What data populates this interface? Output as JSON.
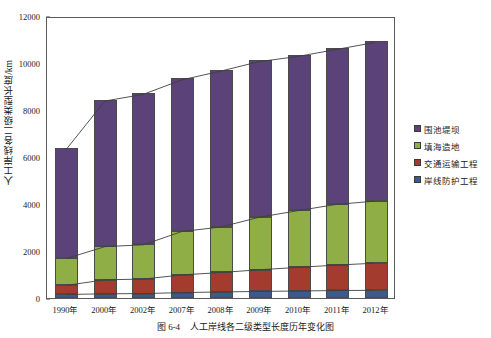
{
  "chart_data": {
    "type": "bar",
    "subtype": "stacked-bar-with-cumulative-lines",
    "title": "",
    "caption_number": "图 6-4",
    "caption_text": "人工岸线各二级类型长度历年变化图",
    "xlabel": "",
    "ylabel": "人工岸线各二级类型长度/km",
    "categories": [
      "1990年",
      "2000年",
      "2002年",
      "2007年",
      "2008年",
      "2009年",
      "2010年",
      "2011年",
      "2012年"
    ],
    "ylim": [
      0,
      12000
    ],
    "yticks": [
      0,
      2000,
      4000,
      6000,
      8000,
      10000,
      12000
    ],
    "ytick_labels": [
      "0",
      "2000",
      "4000",
      "6000",
      "8000",
      "10000",
      "12000"
    ],
    "grid": false,
    "legend_position": "right",
    "series": [
      {
        "name": "岸线防护工程",
        "color": "#3c5a8c",
        "values": [
          150,
          180,
          190,
          230,
          260,
          280,
          300,
          320,
          330
        ]
      },
      {
        "name": "交通运输工程",
        "color": "#a33c2e",
        "values": [
          390,
          600,
          620,
          760,
          830,
          930,
          1010,
          1090,
          1160
        ]
      },
      {
        "name": "填海造地",
        "color": "#8fae45",
        "values": [
          1150,
          1420,
          1470,
          1860,
          1950,
          2250,
          2430,
          2600,
          2660
        ]
      },
      {
        "name": "围池堤坝",
        "color": "#5b4279",
        "values": [
          4680,
          6240,
          6450,
          6500,
          6680,
          6670,
          6610,
          6640,
          6800
        ]
      }
    ],
    "totals": [
      6370,
      8440,
      8730,
      9350,
      9720,
      10130,
      10350,
      10650,
      10950
    ],
    "cumulative_lines": [
      {
        "name": "岸线防护工程累计",
        "values": [
          150,
          180,
          190,
          230,
          260,
          280,
          300,
          320,
          330
        ]
      },
      {
        "name": "+交通运输工程累计",
        "values": [
          540,
          780,
          810,
          990,
          1090,
          1210,
          1310,
          1410,
          1490
        ]
      },
      {
        "name": "+填海造地累计",
        "values": [
          1690,
          2200,
          2280,
          2850,
          3040,
          3460,
          3740,
          4010,
          4150
        ]
      },
      {
        "name": "总计",
        "values": [
          6370,
          8440,
          8730,
          9350,
          9720,
          10130,
          10350,
          10650,
          10950
        ]
      }
    ]
  },
  "legend": {
    "items": [
      {
        "label": "围池堤坝",
        "color": "#5b4279"
      },
      {
        "label": "填海造地",
        "color": "#8fae45"
      },
      {
        "label": "交通运输工程",
        "color": "#a33c2e"
      },
      {
        "label": "岸线防护工程",
        "color": "#3c5a8c"
      }
    ]
  },
  "caption": {
    "number": "图 6-4",
    "text": "人工岸线各二级类型长度历年变化图"
  }
}
